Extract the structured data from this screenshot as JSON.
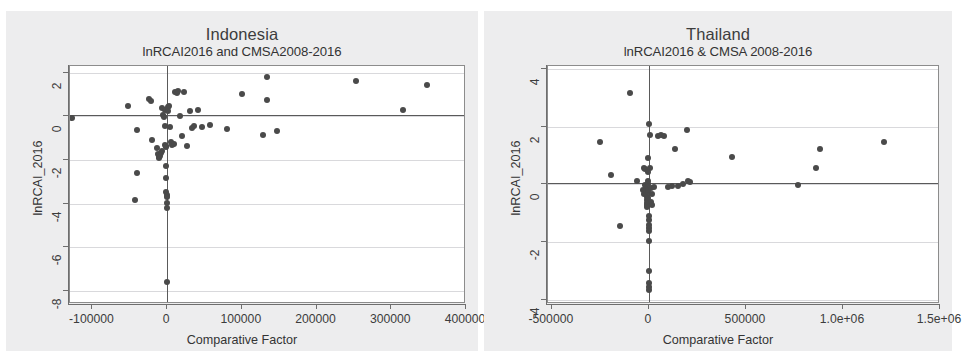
{
  "figure": {
    "background": "#ffffff",
    "panel_background": "#ededee",
    "plot_background": "#ffffff",
    "point_color": "#4a4a4a",
    "grid_color": "#d9d9dc",
    "axis_color": "#6e6e6e",
    "reference_line_color": "#5a5a5a"
  },
  "chart_data": [
    {
      "type": "scatter",
      "panel": "left",
      "title": "Indonesia",
      "subtitle": "lnRCAI2016 and CMSA2008-2016",
      "xlabel": "Comparative Factor",
      "ylabel": "lnRCAI_2016",
      "xlim": [
        -130000,
        400000
      ],
      "ylim": [
        -8.6,
        2.3
      ],
      "xticks": [
        -100000,
        0,
        100000,
        200000,
        300000,
        400000
      ],
      "xticklabels": [
        "-100000",
        "0",
        "100000",
        "200000",
        "300000",
        "400000"
      ],
      "yticks": [
        2,
        0,
        -2,
        -4,
        -6,
        -8
      ],
      "yticklabels": [
        "2",
        "0",
        "-2",
        "-4",
        "-6",
        "-8"
      ],
      "grid": true,
      "grid_axis": "y",
      "legend": "none",
      "reference_lines": {
        "horizontal_y": 0.05,
        "vertical_x": 0
      },
      "points": [
        [
          -128000,
          -0.1
        ],
        [
          -52000,
          0.45
        ],
        [
          -41000,
          -0.62
        ],
        [
          -40000,
          -2.58
        ],
        [
          -43000,
          -3.84
        ],
        [
          -24000,
          0.8
        ],
        [
          -22000,
          0.72
        ],
        [
          -20000,
          -1.1
        ],
        [
          -13000,
          -1.45
        ],
        [
          -12000,
          -1.75
        ],
        [
          -11000,
          -1.88
        ],
        [
          -10500,
          -1.92
        ],
        [
          -9500,
          -1.82
        ],
        [
          -8000,
          -1.7
        ],
        [
          -7500,
          -1.6
        ],
        [
          -6500,
          0.38
        ],
        [
          -5000,
          0.05
        ],
        [
          -4000,
          -0.02
        ],
        [
          -3500,
          0.3
        ],
        [
          -3000,
          -0.45
        ],
        [
          -2500,
          -1.3
        ],
        [
          -2000,
          -1.35
        ],
        [
          -1800,
          -1.42
        ],
        [
          -1500,
          -2.3
        ],
        [
          -1200,
          -2.85
        ],
        [
          -1000,
          -3.45
        ],
        [
          -800,
          -3.6
        ],
        [
          -600,
          -3.68
        ],
        [
          -500,
          -3.98
        ],
        [
          -300,
          -4.18
        ],
        [
          -200,
          -7.6
        ],
        [
          1000,
          0.42
        ],
        [
          1500,
          0.22
        ],
        [
          2500,
          0.48
        ],
        [
          4000,
          -0.48
        ],
        [
          5000,
          -1.2
        ],
        [
          6000,
          -1.3
        ],
        [
          9000,
          -1.25
        ],
        [
          11000,
          1.12
        ],
        [
          13000,
          1.08
        ],
        [
          14000,
          1.15
        ],
        [
          17000,
          0.03
        ],
        [
          20000,
          -0.92
        ],
        [
          22000,
          1.1
        ],
        [
          26000,
          -1.35
        ],
        [
          30000,
          0.22
        ],
        [
          33000,
          -0.55
        ],
        [
          36000,
          -0.45
        ],
        [
          41000,
          0.28
        ],
        [
          46000,
          -0.5
        ],
        [
          57000,
          -0.42
        ],
        [
          80000,
          -0.6
        ],
        [
          100000,
          1.02
        ],
        [
          128000,
          -0.88
        ],
        [
          133000,
          1.82
        ],
        [
          134000,
          0.75
        ],
        [
          147000,
          -0.68
        ],
        [
          253000,
          1.6
        ],
        [
          316000,
          0.28
        ],
        [
          348000,
          1.45
        ]
      ]
    },
    {
      "type": "scatter",
      "panel": "right",
      "title": "Thailand",
      "subtitle": "lnRCAI2016 & CMSA 2008-2016",
      "xlabel": "Comparative Factor",
      "ylabel": "lnRCAI_2016",
      "xlim": [
        -520000,
        1500000
      ],
      "ylim": [
        -4.15,
        4.1
      ],
      "xticks": [
        -500000,
        0,
        500000,
        1000000,
        1500000
      ],
      "xticklabels": [
        "-500000",
        "0",
        "500000",
        "1.0e+06",
        "1.5e+06"
      ],
      "yticks": [
        4,
        2,
        0,
        -2,
        -4
      ],
      "yticklabels": [
        "4",
        "2",
        "0",
        "-2",
        "-4"
      ],
      "grid": true,
      "grid_axis": "y",
      "legend": "none",
      "reference_lines": {
        "horizontal_y": 0.05,
        "vertical_x": 0
      },
      "points": [
        [
          -250000,
          1.48
        ],
        [
          -195000,
          0.32
        ],
        [
          -150000,
          -1.45
        ],
        [
          -100000,
          3.15
        ],
        [
          -60000,
          0.1
        ],
        [
          -30000,
          -0.2
        ],
        [
          -28000,
          -0.35
        ],
        [
          -25000,
          0.55
        ],
        [
          -20000,
          0.52
        ],
        [
          -18000,
          -0.02
        ],
        [
          -15000,
          -0.12
        ],
        [
          -13000,
          -0.3
        ],
        [
          -12000,
          -0.45
        ],
        [
          -11000,
          -0.55
        ],
        [
          -10000,
          -0.65
        ],
        [
          -9000,
          -0.72
        ],
        [
          -8000,
          -0.8
        ],
        [
          -7000,
          -0.62
        ],
        [
          -6000,
          -0.48
        ],
        [
          -5000,
          -0.28
        ],
        [
          -4500,
          -0.18
        ],
        [
          -4000,
          0.0
        ],
        [
          -3500,
          0.12
        ],
        [
          -3000,
          0.42
        ],
        [
          -2500,
          0.9
        ],
        [
          -2000,
          2.1
        ],
        [
          -1500,
          -1.1
        ],
        [
          -1200,
          -1.25
        ],
        [
          -1000,
          -1.4
        ],
        [
          -800,
          -1.5
        ],
        [
          -600,
          -1.62
        ],
        [
          -500,
          -1.95
        ],
        [
          -400,
          -3.0
        ],
        [
          -300,
          -3.42
        ],
        [
          -200,
          -3.55
        ],
        [
          -150,
          -3.68
        ],
        [
          4000,
          1.72
        ],
        [
          6000,
          0.55
        ],
        [
          9000,
          -0.12
        ],
        [
          12000,
          -0.6
        ],
        [
          15000,
          -0.7
        ],
        [
          18000,
          -0.35
        ],
        [
          25000,
          -0.1
        ],
        [
          45000,
          1.68
        ],
        [
          62000,
          1.7
        ],
        [
          75000,
          1.68
        ],
        [
          100000,
          -0.08
        ],
        [
          120000,
          -0.05
        ],
        [
          135000,
          1.22
        ],
        [
          150000,
          -0.05
        ],
        [
          175000,
          0.0
        ],
        [
          195000,
          1.9
        ],
        [
          200000,
          0.1
        ],
        [
          210000,
          0.08
        ],
        [
          430000,
          0.95
        ],
        [
          770000,
          -0.02
        ],
        [
          860000,
          0.58
        ],
        [
          880000,
          1.22
        ],
        [
          1210000,
          1.48
        ]
      ]
    }
  ]
}
